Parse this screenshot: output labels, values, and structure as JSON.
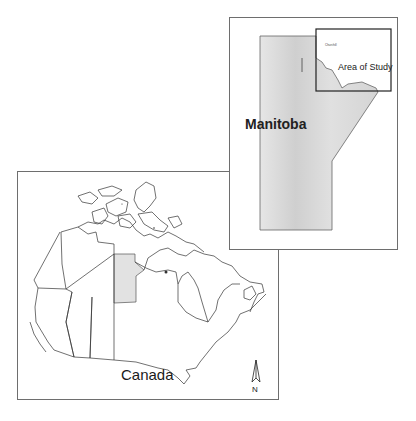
{
  "canada_map": {
    "label": "Canada",
    "north_arrow_label": "N",
    "highlight_province": "Manitoba"
  },
  "inset_map": {
    "province_label": "Manitoba",
    "study_area_label": "Area of Study",
    "town_label": "Churchill"
  },
  "colors": {
    "frame_border": "#6e6e6e",
    "province_fill": "#d8d8d8",
    "outline": "#333333"
  }
}
